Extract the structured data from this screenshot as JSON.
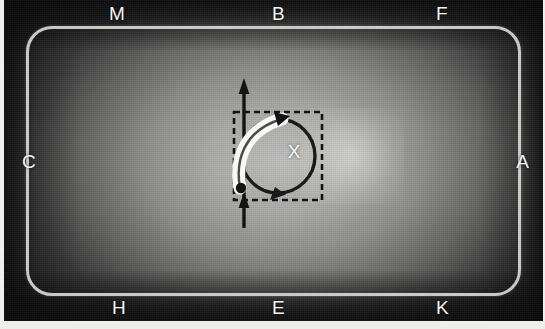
{
  "scene": {
    "kind": "annotated-photograph-diagram",
    "aspect": "545x329"
  },
  "perimeter_labels": {
    "top": [
      {
        "id": "M",
        "text": "M"
      },
      {
        "id": "B",
        "text": "B"
      },
      {
        "id": "F",
        "text": "F"
      }
    ],
    "left": [
      {
        "id": "C",
        "text": "C"
      }
    ],
    "right": [
      {
        "id": "A",
        "text": "A"
      }
    ],
    "bottom": [
      {
        "id": "H",
        "text": "H"
      },
      {
        "id": "E",
        "text": "E"
      },
      {
        "id": "K",
        "text": "K"
      }
    ]
  },
  "center": {
    "label": "X",
    "square_style": "dashed",
    "circle_arrow_direction": "clockwise",
    "circle_arrowheads": 2,
    "white_curved_arrow": "present",
    "vertical_arrow": "double-ended-up"
  },
  "colors": {
    "frame_outline": "#d7d7d4",
    "label_text": "#f4f4f2",
    "dark_ink": "#141414",
    "white_ink": "#f7f7f5",
    "glow": "#ffffff",
    "page_margin": "#eeeeec"
  }
}
